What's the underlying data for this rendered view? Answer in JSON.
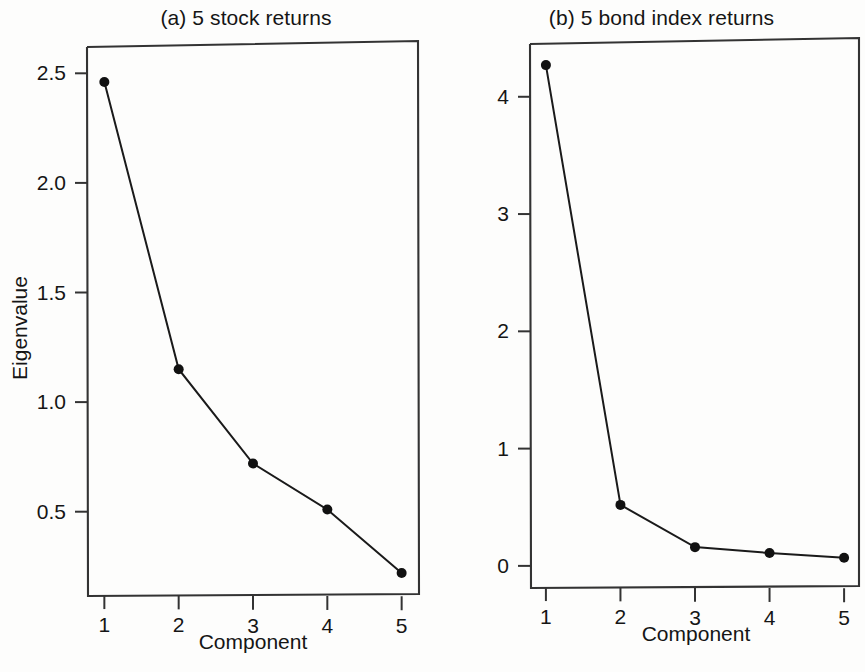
{
  "figure": {
    "background_color": "#fdfdfc",
    "ink_color": "#1a1a1a"
  },
  "panels": [
    {
      "id": "a",
      "title": "(a) 5 stock returns",
      "xlabel": "Component",
      "ylabel": "Eigenvalue"
    },
    {
      "id": "b",
      "title": "(b) 5 bond index returns",
      "xlabel": "Component",
      "ylabel": "Eigenvalue"
    }
  ],
  "chart_data": [
    {
      "type": "line",
      "title": "(a) 5 stock returns",
      "xlabel": "Component",
      "ylabel": "Eigenvalue",
      "x": [
        1,
        2,
        3,
        4,
        5
      ],
      "values": [
        2.46,
        1.15,
        0.72,
        0.51,
        0.22
      ],
      "xticks": [
        "1",
        "2",
        "3",
        "4",
        "5"
      ],
      "yticks": [
        "0.5",
        "1.0",
        "1.5",
        "2.0",
        "2.5"
      ],
      "ytick_values": [
        0.5,
        1.0,
        1.5,
        2.0,
        2.5
      ],
      "xlim": [
        0.78,
        5.22
      ],
      "ylim": [
        0.12,
        2.62
      ],
      "grid": false,
      "legend": "none",
      "marker": "filled-circle",
      "line_color": "#1a1a1a"
    },
    {
      "type": "line",
      "title": "(b) 5 bond index returns",
      "xlabel": "Component",
      "ylabel": "Eigenvalue",
      "x": [
        1,
        2,
        3,
        4,
        5
      ],
      "values": [
        4.27,
        0.52,
        0.16,
        0.11,
        0.07
      ],
      "xticks": [
        "1",
        "2",
        "3",
        "4",
        "5"
      ],
      "yticks": [
        "0",
        "1",
        "2",
        "3",
        "4"
      ],
      "ytick_values": [
        0,
        1,
        2,
        3,
        4
      ],
      "xlim": [
        0.8,
        5.2
      ],
      "ylim": [
        -0.18,
        4.45
      ],
      "grid": false,
      "legend": "none",
      "marker": "filled-circle",
      "line_color": "#1a1a1a"
    }
  ]
}
